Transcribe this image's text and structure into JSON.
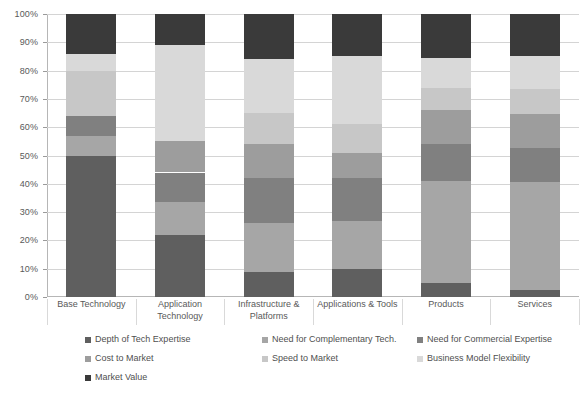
{
  "chart_data": {
    "type": "bar",
    "subtype": "stacked-100-percent",
    "title": "",
    "xlabel": "",
    "ylabel": "",
    "ylim": [
      0,
      100
    ],
    "y_tick_labels": [
      "100%",
      "90%",
      "80%",
      "70%",
      "60%",
      "50%",
      "40%",
      "30%",
      "20%",
      "10%",
      "0%"
    ],
    "y_tick_values": [
      100,
      90,
      80,
      70,
      60,
      50,
      40,
      30,
      20,
      10,
      0
    ],
    "grid": true,
    "legend_position": "bottom",
    "categories": [
      "Base Technology",
      "Application Technology",
      "Infrastructure & Platforms",
      "Applications & Tools",
      "Products",
      "Services"
    ],
    "series": [
      {
        "name": "Depth of Tech Expertise",
        "color": "#5f5f5f",
        "values": [
          50,
          22,
          9,
          10,
          5,
          2.5
        ]
      },
      {
        "name": "Need for Complementary Tech.",
        "color": "#a6a6a6",
        "values": [
          7,
          11.5,
          17,
          17,
          36,
          38
        ]
      },
      {
        "name": "Need for Commercial Expertise",
        "color": "#808080",
        "values": [
          7,
          10.5,
          16,
          15,
          13,
          12
        ]
      },
      {
        "name": "Cost to Market",
        "color": "#9d9d9d",
        "values": [
          0,
          11,
          12,
          9,
          12,
          12
        ]
      },
      {
        "name": "Speed to Market",
        "color": "#c7c7c7",
        "values": [
          16,
          0,
          11,
          10,
          8,
          9
        ]
      },
      {
        "name": "Business Model Flexibility",
        "color": "#d9d9d9",
        "values": [
          6,
          34,
          19,
          24,
          10.5,
          11.5
        ]
      },
      {
        "name": "Market Value",
        "color": "#3a3a3a",
        "values": [
          14,
          11,
          16,
          15,
          15.5,
          15
        ]
      }
    ]
  },
  "legend": {
    "items": [
      {
        "label": "Depth of Tech Expertise",
        "color": "#5f5f5f"
      },
      {
        "label": "Need for Complementary Tech.",
        "color": "#a6a6a6"
      },
      {
        "label": "Need for Commercial Expertise",
        "color": "#808080"
      },
      {
        "label": "Cost to Market",
        "color": "#9d9d9d"
      },
      {
        "label": "Speed to Market",
        "color": "#c7c7c7"
      },
      {
        "label": "Business Model Flexibility",
        "color": "#d9d9d9"
      },
      {
        "label": "Market Value",
        "color": "#3a3a3a"
      }
    ]
  },
  "colors": {
    "background": "#ffffff",
    "gridline": "#d4d4d4",
    "axis": "#b6b6b6",
    "text": "#595959"
  }
}
